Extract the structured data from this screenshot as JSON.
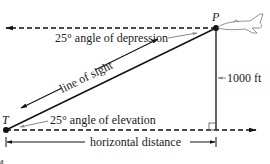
{
  "diagram": {
    "points": {
      "P": {
        "label": "P"
      },
      "T": {
        "label": "T"
      }
    },
    "labels": {
      "depression": "25° angle of depression",
      "elevation": "25° angle of elevation",
      "line_of_sight": "line of sight",
      "height": "1000 ft",
      "horizontal": "horizontal distance",
      "corner": "a"
    },
    "colors": {
      "line": "#111111",
      "pointer": "#888888"
    }
  }
}
